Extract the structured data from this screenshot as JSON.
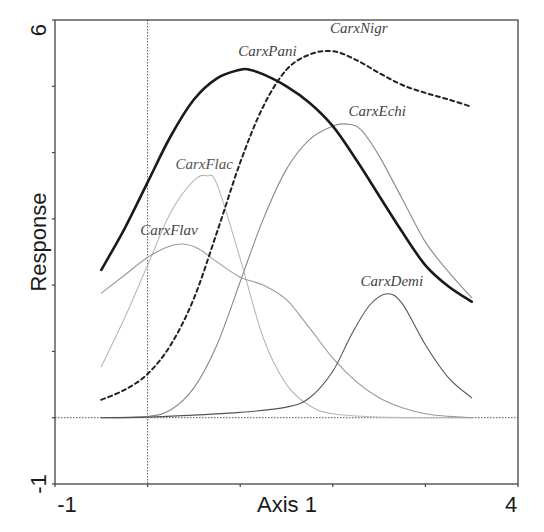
{
  "chart_data": {
    "type": "line",
    "title": "",
    "xlabel": "Axis 1",
    "ylabel": "Response",
    "xlim": [
      -1,
      4
    ],
    "ylim": [
      -1,
      6
    ],
    "x_tick_labels": [
      "-1",
      "4"
    ],
    "y_tick_labels": [
      "-1",
      "6"
    ],
    "x_ticks": [
      -1,
      0,
      1,
      2,
      3,
      4
    ],
    "y_ticks": [
      -1,
      0,
      1,
      2,
      3,
      4,
      5,
      6
    ],
    "reference_lines": {
      "x": 0,
      "y": 0
    },
    "grid": false,
    "legend": "none (curves labelled directly)",
    "series": [
      {
        "name": "CarxPani",
        "style": "solid-thick",
        "color": "#1a1a1a",
        "label_pos": [
          0.98,
          5.45
        ],
        "x": [
          -0.5,
          -0.25,
          0.0,
          0.25,
          0.5,
          0.75,
          1.0,
          1.1,
          1.25,
          1.5,
          1.75,
          2.0,
          2.25,
          2.5,
          2.75,
          3.0,
          3.25,
          3.5
        ],
        "y": [
          2.23,
          2.85,
          3.55,
          4.25,
          4.8,
          5.12,
          5.25,
          5.25,
          5.18,
          5.0,
          4.75,
          4.4,
          3.9,
          3.35,
          2.8,
          2.3,
          1.98,
          1.75
        ]
      },
      {
        "name": "CarxNigr",
        "style": "dashed",
        "color": "#222222",
        "label_pos": [
          1.97,
          5.8
        ],
        "x": [
          -0.5,
          -0.25,
          0.0,
          0.25,
          0.5,
          0.75,
          1.0,
          1.25,
          1.5,
          1.75,
          2.0,
          2.25,
          2.5,
          2.75,
          3.0,
          3.25,
          3.5
        ],
        "y": [
          0.27,
          0.42,
          0.66,
          1.1,
          1.8,
          2.8,
          3.85,
          4.7,
          5.25,
          5.48,
          5.53,
          5.4,
          5.2,
          5.02,
          4.9,
          4.8,
          4.69
        ]
      },
      {
        "name": "CarxEchi",
        "style": "solid-thin",
        "color": "#8a8a8a",
        "label_pos": [
          2.17,
          4.55
        ],
        "x": [
          -0.5,
          0.0,
          0.25,
          0.5,
          0.75,
          1.0,
          1.25,
          1.5,
          1.75,
          2.0,
          2.15,
          2.3,
          2.5,
          2.75,
          3.0,
          3.25,
          3.5
        ],
        "y": [
          0.0,
          0.02,
          0.12,
          0.45,
          1.1,
          2.05,
          3.0,
          3.75,
          4.2,
          4.4,
          4.43,
          4.35,
          3.95,
          3.3,
          2.65,
          2.2,
          1.81
        ]
      },
      {
        "name": "CarxFlac",
        "style": "solid-thin",
        "color": "#b8b8b8",
        "label_pos": [
          0.3,
          3.75
        ],
        "x": [
          -0.5,
          -0.25,
          0.0,
          0.25,
          0.5,
          0.64,
          0.75,
          1.0,
          1.25,
          1.5,
          1.75,
          2.0,
          2.5,
          3.0,
          3.5
        ],
        "y": [
          0.77,
          1.5,
          2.3,
          3.1,
          3.58,
          3.65,
          3.52,
          2.4,
          1.2,
          0.5,
          0.18,
          0.06,
          0.01,
          0.0,
          0.0
        ],
        "label_color": "#555555"
      },
      {
        "name": "CarxFlav",
        "style": "solid-thin",
        "color": "#9a9a9a",
        "label_pos": [
          -0.08,
          2.75
        ],
        "x": [
          -0.5,
          -0.25,
          0.0,
          0.2,
          0.38,
          0.55,
          0.75,
          1.0,
          1.25,
          1.5,
          1.75,
          2.0,
          2.25,
          2.5,
          2.75,
          3.0,
          3.25,
          3.5
        ],
        "y": [
          1.88,
          2.15,
          2.42,
          2.57,
          2.62,
          2.55,
          2.35,
          2.12,
          2.0,
          1.78,
          1.35,
          0.9,
          0.55,
          0.3,
          0.15,
          0.06,
          0.02,
          0.0
        ]
      },
      {
        "name": "CarxDemi",
        "style": "solid-thin",
        "color": "#555555",
        "label_pos": [
          2.3,
          1.98
        ],
        "x": [
          -0.5,
          0.0,
          0.5,
          1.0,
          1.5,
          1.75,
          2.0,
          2.2,
          2.4,
          2.59,
          2.75,
          3.0,
          3.25,
          3.5
        ],
        "y": [
          0.0,
          0.01,
          0.04,
          0.08,
          0.16,
          0.3,
          0.7,
          1.25,
          1.7,
          1.87,
          1.72,
          1.1,
          0.6,
          0.3
        ]
      }
    ]
  },
  "axes": {
    "xlabel": "Axis 1",
    "ylabel": "Response",
    "x_min_label": "-1",
    "x_max_label": "4",
    "y_min_label": "-1",
    "y_max_label": "6"
  },
  "plot_box": {
    "left": 55,
    "right": 518,
    "top": 20,
    "bottom": 484
  }
}
